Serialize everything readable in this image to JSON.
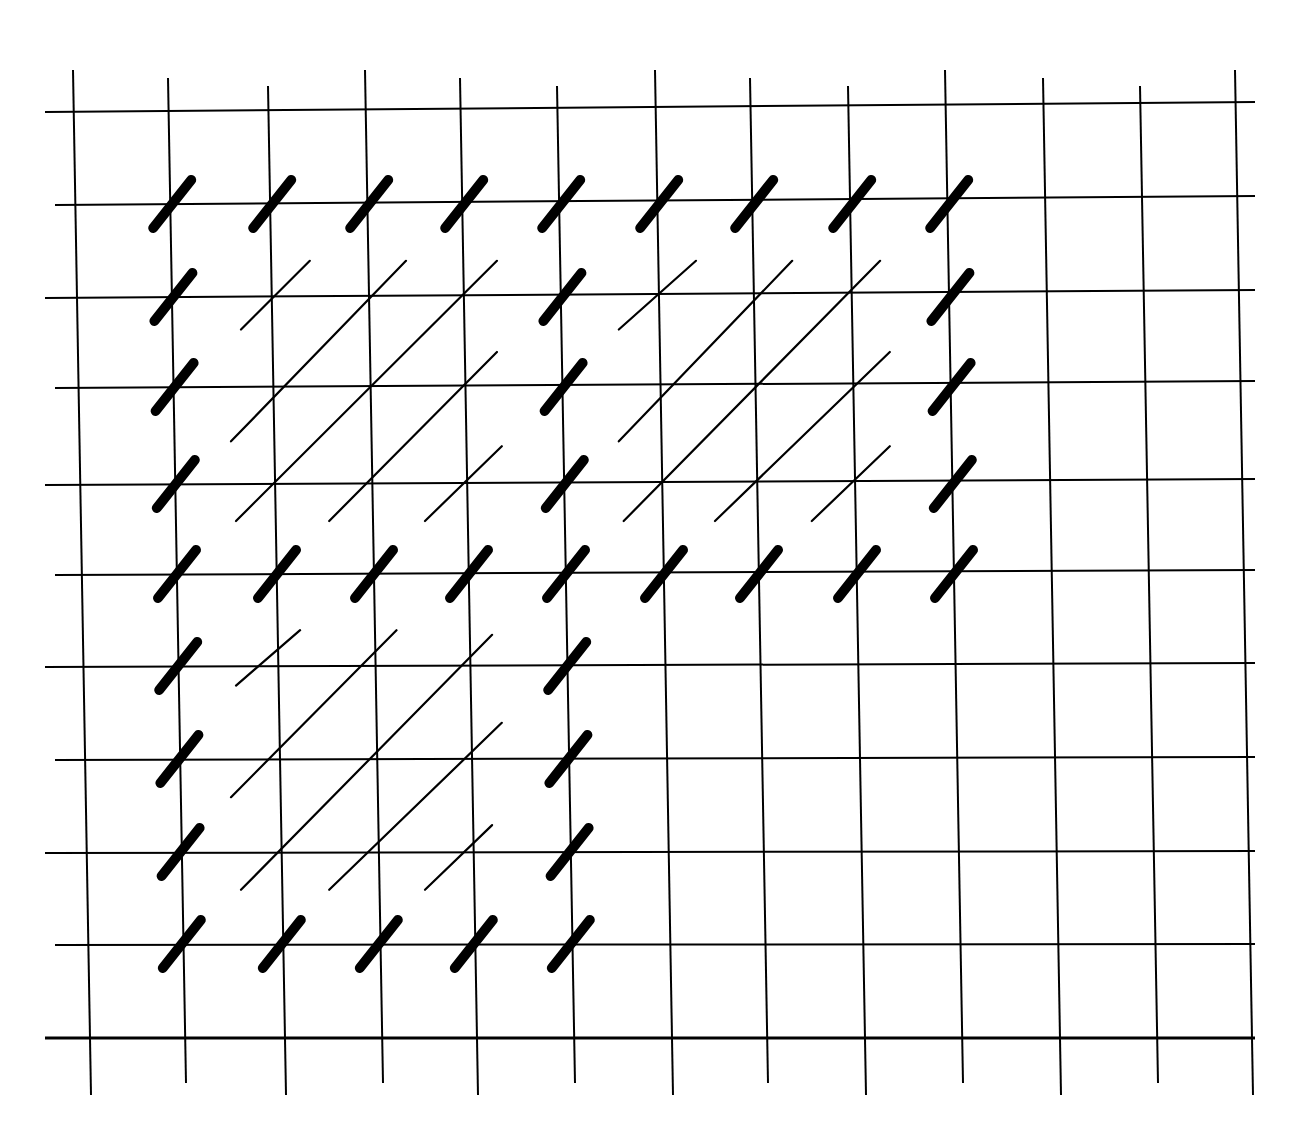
{
  "diagram": {
    "type": "stitch-grid",
    "background": "#ffffff",
    "ink": "#000000",
    "grid": {
      "vertical_x": [
        73,
        168,
        268,
        365,
        460,
        557,
        655,
        750,
        848,
        945,
        1043,
        1140,
        1235
      ],
      "horizontal_y": [
        112,
        205,
        298,
        388,
        485,
        575,
        667,
        760,
        853,
        945,
        1038
      ],
      "top": 70,
      "bottom": 1095,
      "left": 45,
      "right": 1255
    },
    "thick_stitches": [
      {
        "c": 1,
        "r": 1
      },
      {
        "c": 2,
        "r": 1
      },
      {
        "c": 3,
        "r": 1
      },
      {
        "c": 4,
        "r": 1
      },
      {
        "c": 5,
        "r": 1
      },
      {
        "c": 6,
        "r": 1
      },
      {
        "c": 7,
        "r": 1
      },
      {
        "c": 8,
        "r": 1
      },
      {
        "c": 9,
        "r": 1
      },
      {
        "c": 1,
        "r": 2
      },
      {
        "c": 5,
        "r": 2
      },
      {
        "c": 9,
        "r": 2
      },
      {
        "c": 1,
        "r": 3
      },
      {
        "c": 5,
        "r": 3
      },
      {
        "c": 9,
        "r": 3
      },
      {
        "c": 1,
        "r": 4
      },
      {
        "c": 5,
        "r": 4
      },
      {
        "c": 9,
        "r": 4
      },
      {
        "c": 1,
        "r": 5
      },
      {
        "c": 2,
        "r": 5
      },
      {
        "c": 3,
        "r": 5
      },
      {
        "c": 4,
        "r": 5
      },
      {
        "c": 5,
        "r": 5
      },
      {
        "c": 6,
        "r": 5
      },
      {
        "c": 7,
        "r": 5
      },
      {
        "c": 8,
        "r": 5
      },
      {
        "c": 9,
        "r": 5
      },
      {
        "c": 1,
        "r": 6
      },
      {
        "c": 5,
        "r": 6
      },
      {
        "c": 1,
        "r": 7
      },
      {
        "c": 5,
        "r": 7
      },
      {
        "c": 1,
        "r": 8
      },
      {
        "c": 5,
        "r": 8
      },
      {
        "c": 1,
        "r": 9
      },
      {
        "c": 2,
        "r": 9
      },
      {
        "c": 3,
        "r": 9
      },
      {
        "c": 4,
        "r": 9
      },
      {
        "c": 5,
        "r": 9
      }
    ],
    "thin_diagonals": [
      {
        "from": {
          "c": 1.7,
          "r": 2.35
        },
        "to": {
          "c": 2.4,
          "r": 1.6
        }
      },
      {
        "from": {
          "c": 1.6,
          "r": 3.55
        },
        "to": {
          "c": 3.4,
          "r": 1.6
        }
      },
      {
        "from": {
          "c": 1.65,
          "r": 4.4
        },
        "to": {
          "c": 4.35,
          "r": 1.6
        }
      },
      {
        "from": {
          "c": 2.6,
          "r": 4.4
        },
        "to": {
          "c": 4.35,
          "r": 2.6
        }
      },
      {
        "from": {
          "c": 3.6,
          "r": 4.4
        },
        "to": {
          "c": 4.4,
          "r": 3.6
        }
      },
      {
        "from": {
          "c": 5.6,
          "r": 2.35
        },
        "to": {
          "c": 6.4,
          "r": 1.6
        }
      },
      {
        "from": {
          "c": 5.6,
          "r": 3.55
        },
        "to": {
          "c": 7.4,
          "r": 1.6
        }
      },
      {
        "from": {
          "c": 5.65,
          "r": 4.4
        },
        "to": {
          "c": 8.3,
          "r": 1.6
        }
      },
      {
        "from": {
          "c": 6.6,
          "r": 4.4
        },
        "to": {
          "c": 8.4,
          "r": 2.6
        }
      },
      {
        "from": {
          "c": 7.6,
          "r": 4.4
        },
        "to": {
          "c": 8.4,
          "r": 3.6
        }
      },
      {
        "from": {
          "c": 1.65,
          "r": 6.2
        },
        "to": {
          "c": 2.3,
          "r": 5.6
        }
      },
      {
        "from": {
          "c": 1.6,
          "r": 7.4
        },
        "to": {
          "c": 3.3,
          "r": 5.6
        }
      },
      {
        "from": {
          "c": 1.7,
          "r": 8.4
        },
        "to": {
          "c": 4.3,
          "r": 5.65
        }
      },
      {
        "from": {
          "c": 2.6,
          "r": 8.4
        },
        "to": {
          "c": 4.4,
          "r": 6.6
        }
      },
      {
        "from": {
          "c": 3.6,
          "r": 8.4
        },
        "to": {
          "c": 4.3,
          "r": 7.7
        }
      }
    ]
  }
}
